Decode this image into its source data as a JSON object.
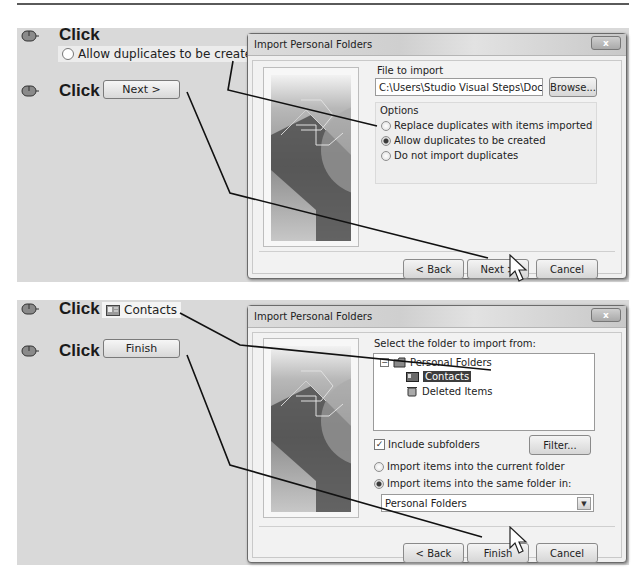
{
  "panel1": {
    "steps": [
      {
        "action": "Click",
        "target": {
          "type": "radio",
          "label": "Allow duplicates to be created"
        }
      },
      {
        "action": "Click",
        "target": {
          "type": "button",
          "label": "Next >"
        }
      }
    ],
    "dialog": {
      "title": "Import Personal Folders",
      "close_label": "x",
      "file_label": "File to import",
      "file_value": "C:\\Users\\Studio Visual Steps\\Documents\\",
      "browse_label": "Browse...",
      "options_label": "Options",
      "options": [
        {
          "label": "Replace duplicates with items imported",
          "selected": false
        },
        {
          "label": "Allow duplicates to be created",
          "selected": true
        },
        {
          "label": "Do not import duplicates",
          "selected": false
        }
      ],
      "buttons": {
        "back": "< Back",
        "next": "Next >",
        "cancel": "Cancel"
      }
    }
  },
  "panel2": {
    "steps": [
      {
        "action": "Click",
        "target": {
          "type": "tree-item",
          "icon": "contacts-icon",
          "label": "Contacts"
        }
      },
      {
        "action": "Click",
        "target": {
          "type": "button",
          "label": "Finish"
        }
      }
    ],
    "dialog": {
      "title": "Import Personal Folders",
      "close_label": "x",
      "select_label": "Select the folder to import from:",
      "tree": {
        "root": "Personal Folders",
        "children": [
          {
            "label": "Contacts",
            "icon": "contacts-icon",
            "selected": true
          },
          {
            "label": "Deleted Items",
            "icon": "trash-icon",
            "selected": false
          }
        ]
      },
      "include_subfolders_label": "Include subfolders",
      "include_subfolders_checked": true,
      "filter_label": "Filter...",
      "import_options": [
        {
          "label": "Import items into the current folder",
          "selected": false
        },
        {
          "label": "Import items into the same folder in:",
          "selected": true
        }
      ],
      "target_folder": "Personal Folders",
      "buttons": {
        "back": "< Back",
        "finish": "Finish",
        "cancel": "Cancel"
      }
    }
  }
}
